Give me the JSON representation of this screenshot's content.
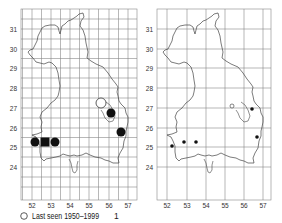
{
  "maps": [
    {
      "id": "left",
      "y_ticks": [
        "31",
        "30",
        "29",
        "28",
        "27",
        "26",
        "25",
        "24"
      ],
      "x_ticks": [
        "52",
        "53",
        "54",
        "55",
        "56",
        "57"
      ],
      "grid": "half-degree",
      "legend": [
        {
          "symbol": "open-circle",
          "label": "Last seen 1950–1999",
          "count": "1"
        },
        {
          "symbol": "filled-square",
          "label": "Pre-2000 and 2000–2018",
          "count": "1"
        },
        {
          "symbol": "filled-circle",
          "label": "2000–2018 only",
          "count": "4"
        }
      ],
      "markers": [
        {
          "type": "open-circle",
          "x": 101,
          "y": 103,
          "r": 5
        },
        {
          "type": "filled-circle",
          "x": 111,
          "y": 113,
          "r": 4.5
        },
        {
          "type": "filled-circle",
          "x": 121,
          "y": 132,
          "r": 4.5
        },
        {
          "type": "filled-circle",
          "x": 35,
          "y": 142,
          "r": 4.5
        },
        {
          "type": "filled-square",
          "x": 45,
          "y": 142,
          "r": 4.5
        },
        {
          "type": "filled-circle",
          "x": 55,
          "y": 142,
          "r": 4.5
        }
      ]
    },
    {
      "id": "right",
      "y_ticks": [
        "31",
        "30",
        "29",
        "28",
        "27",
        "26",
        "25",
        "24"
      ],
      "x_ticks": [
        "52",
        "53",
        "54",
        "55",
        "56",
        "57"
      ],
      "grid": "one-degree",
      "legend": [
        {
          "symbol": "open-circle",
          "label": "Last seen pre-2000",
          "count": "1"
        },
        {
          "symbol": "filled-circle",
          "label": "Seen 2000–2018",
          "count": "5"
        }
      ],
      "markers": [
        {
          "type": "open-circle",
          "x": 232,
          "y": 106,
          "r": 2
        },
        {
          "type": "filled-circle",
          "x": 252,
          "y": 109,
          "r": 1.8
        },
        {
          "type": "filled-circle",
          "x": 257,
          "y": 137,
          "r": 1.8
        },
        {
          "type": "filled-circle",
          "x": 172,
          "y": 146,
          "r": 1.8
        },
        {
          "type": "filled-circle",
          "x": 184,
          "y": 142,
          "r": 1.8
        },
        {
          "type": "filled-circle",
          "x": 196,
          "y": 142,
          "r": 1.8
        }
      ]
    }
  ]
}
